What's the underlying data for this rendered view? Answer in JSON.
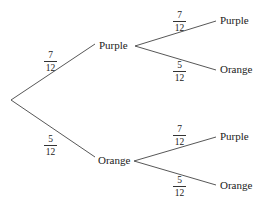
{
  "tree": {
    "root": {
      "x": 11,
      "y": 100
    },
    "level1": [
      {
        "outcome": "Purple",
        "probability": "7/12",
        "num": "7",
        "den": "12",
        "node": {
          "x": 96,
          "y": 46
        }
      },
      {
        "outcome": "Orange",
        "probability": "5/12",
        "num": "5",
        "den": "12",
        "node": {
          "x": 96,
          "y": 157
        }
      }
    ],
    "level2": [
      {
        "parent": "Purple",
        "outcome": "Purple",
        "probability": "7/12",
        "num": "7",
        "den": "12"
      },
      {
        "parent": "Purple",
        "outcome": "Orange",
        "probability": "5/12",
        "num": "5",
        "den": "12"
      },
      {
        "parent": "Orange",
        "outcome": "Purple",
        "probability": "7/12",
        "num": "7",
        "den": "12"
      },
      {
        "parent": "Orange",
        "outcome": "Orange",
        "probability": "5/12",
        "num": "5",
        "den": "12"
      }
    ]
  },
  "colors": {
    "line": "#444444",
    "text": "#222222",
    "background": "#ffffff"
  }
}
